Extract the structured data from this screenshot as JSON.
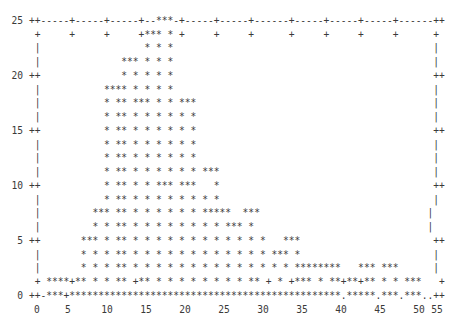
{
  "plot": {
    "lines": [
      "",
      "  25 ++-----+-----+-----+--***-+-----+-----+------+-----+-----+-----+------++",
      "      +     +     +     +*** * +     +     +      +     +     +     +      +",
      "      |                  * * *                                             |",
      "      |              *** * * *                                             |",
      "  20 ++              * * * * *                                             ++",
      "      |           **** * * * *                                             |",
      "      |           * ** *** * * ***                                         |",
      "      |           * ** * * * * * *                                         |",
      "  15 ++           * ** * * * * * *                                         ++",
      "      |           * ** * * * * * *                                         |",
      "      |           * ** * * * * * *                                         |",
      "      |           * ** * * * * * * ***                                     |",
      "  10 ++           * ** * * *** ***   *                                     ++",
      "      |           * ** * * * * * * * *                                     |",
      "      |         *** ** * * * * * * *****  ***                             |",
      "      |         * * ** * * * * * * * * *** *                              |",
      "   5 ++       *** * ** * * * * * * * * * * * *   ***                       ++",
      "      |       * * * ** * * * * * * * * * * * * *** *                       |",
      "      |       * * * ** * * * * * * * * * * * * * * ********   *** ***      |",
      "      + ****+** * * ** +** * * * * * * * * ** + * +*** * **+**+** * * ***   +",
      "   0 ++-***+***********************************************.*****.***.***..++"
    ],
    "x_tick_labels": [
      {
        "label": "0",
        "x": 37
      },
      {
        "label": "5",
        "x": 68
      },
      {
        "label": "10",
        "x": 107
      },
      {
        "label": "15",
        "x": 146
      },
      {
        "label": "20",
        "x": 185
      },
      {
        "label": "25",
        "x": 224
      },
      {
        "label": "30",
        "x": 263
      },
      {
        "label": "35",
        "x": 302
      },
      {
        "label": "40",
        "x": 341
      },
      {
        "label": "45",
        "x": 380
      },
      {
        "label": "50",
        "x": 419
      },
      {
        "label": "55",
        "x": 437
      }
    ],
    "text_color": "#3a3a3a",
    "background": "#ffffff"
  },
  "chart_data": {
    "type": "bar",
    "style": "ascii (gnuplot dumb terminal), histogram drawn with '*' characters",
    "title": "",
    "xlabel": "",
    "ylabel": "",
    "xlim": [
      0,
      55
    ],
    "ylim": [
      0,
      25
    ],
    "x_ticks": [
      0,
      5,
      10,
      15,
      20,
      25,
      30,
      35,
      40,
      45,
      50,
      55
    ],
    "y_ticks": [
      0,
      5,
      10,
      15,
      20,
      25
    ],
    "grid": false,
    "legend": null,
    "x": [
      2,
      3,
      4,
      5,
      6,
      7,
      8,
      9,
      10,
      11,
      12,
      13,
      14,
      15,
      16,
      17,
      18,
      19,
      20,
      21,
      22,
      23,
      24,
      25,
      26,
      27,
      28,
      29,
      30,
      31,
      32,
      33,
      34,
      35,
      36,
      37,
      38,
      39,
      40,
      41,
      42,
      43,
      44,
      45,
      46,
      47,
      48,
      49,
      50
    ],
    "values": [
      1,
      1,
      1,
      1,
      5,
      6,
      8,
      8,
      19,
      19,
      21,
      21,
      22,
      24,
      25,
      25,
      24,
      18,
      18,
      17,
      12,
      11,
      11,
      9,
      9,
      9,
      9,
      9,
      8,
      6,
      5,
      5,
      5,
      3,
      3,
      3,
      2,
      2,
      2,
      1,
      1,
      2,
      2,
      2,
      2,
      2,
      2,
      1,
      1
    ]
  }
}
